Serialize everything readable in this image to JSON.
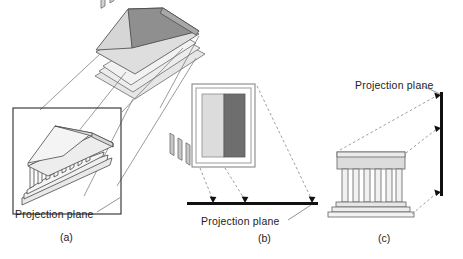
{
  "figure": {
    "panels": [
      {
        "id": "a",
        "sublabel": "(a)",
        "plane_label": "Projection plane",
        "plane_type": "rectangular-frame",
        "ray_style": "solid",
        "object": "3D temple with gabled roof and colonnade",
        "projected_image": "wireframe temple on plinth"
      },
      {
        "id": "b",
        "sublabel": "(b)",
        "plane_label": "Projection plane",
        "plane_type": "horizontal-line",
        "ray_style": "dashed",
        "ray_count": 3,
        "object": "rectangular picture with two vertical panels",
        "panel_left_fill": "#dcdcdc",
        "panel_right_fill": "#6e6e6e"
      },
      {
        "id": "c",
        "sublabel": "(c)",
        "plane_label": "Projection plane",
        "plane_type": "vertical-line",
        "ray_style": "dashed",
        "ray_count": 3,
        "object": "temple front elevation with columns and stepped base"
      }
    ]
  },
  "colors": {
    "ink": "#1c1c1c",
    "outline": "#4a4a4a",
    "roof_dark": "#8d8d8d",
    "roof_light": "#cfcfcf",
    "wall_light": "#e3e3e3",
    "wall_mid": "#c4c4c4",
    "column": "#efefef",
    "panel_light": "#dcdcdc",
    "panel_dark": "#6e6e6e",
    "plane_line": "#111111"
  }
}
